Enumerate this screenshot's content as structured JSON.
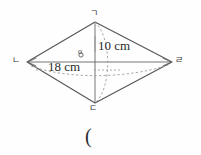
{
  "figure": {
    "type": "rhombus-geometry-diagram",
    "vertices": [
      {
        "name": "top",
        "label": "ㄱ",
        "x": 95,
        "y": 22
      },
      {
        "name": "left",
        "label": "ㄴ",
        "x": 27,
        "y": 62
      },
      {
        "name": "bottom",
        "label": "ㄷ",
        "x": 95,
        "y": 103
      },
      {
        "name": "right",
        "label": "ㄹ",
        "x": 172,
        "y": 62
      }
    ],
    "center_label": "o",
    "measurements": [
      {
        "name": "vertical-diagonal",
        "label": "10 cm",
        "value": 10,
        "unit": "cm"
      },
      {
        "name": "horizontal-diagonal",
        "label": "18 cm",
        "value": 18,
        "unit": "cm"
      }
    ],
    "below_text": "(",
    "colors": {
      "outline": "#555555",
      "dashed": "#8a8a8a",
      "text": "#2a2a2a",
      "background": "#fefefe"
    }
  }
}
